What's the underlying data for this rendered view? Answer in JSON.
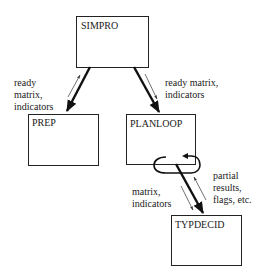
{
  "diagram": {
    "nodes": [
      {
        "id": "simpro",
        "label": "SIMPRO"
      },
      {
        "id": "prep",
        "label": "PREP"
      },
      {
        "id": "planloop",
        "label": "PLANLOOP"
      },
      {
        "id": "typdecid",
        "label": "TYPDECID"
      }
    ],
    "edges": [
      {
        "from": "simpro",
        "to": "prep",
        "label_lines": [
          "ready",
          "matrix,",
          "indicators"
        ]
      },
      {
        "from": "simpro",
        "to": "planloop",
        "label_lines": [
          "ready matrix,",
          "indicators"
        ]
      },
      {
        "from": "planloop",
        "to": "typdecid",
        "label_lines": [
          "matrix,",
          "indicators"
        ]
      },
      {
        "from": "typdecid",
        "to": "planloop",
        "label_lines": [
          "partial",
          "results,",
          "flags, etc."
        ]
      },
      {
        "from": "planloop",
        "to": "planloop",
        "label_lines": [],
        "type": "loop"
      }
    ]
  }
}
